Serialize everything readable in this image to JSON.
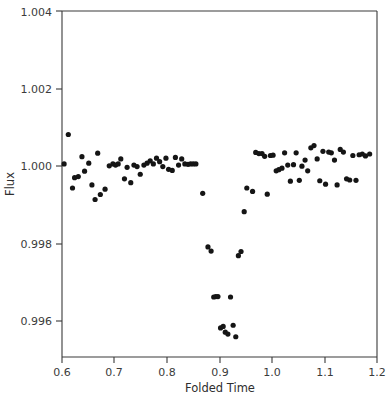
{
  "figure": {
    "background_color": "#ffffff",
    "axis_color": "#3a3a3a",
    "marker_color": "#151515"
  },
  "axes": {
    "xlabel": "Folded Time",
    "ylabel": "Flux",
    "x_ticks": [
      "0.6",
      "0.7",
      "0.8",
      "0.9",
      "1.0",
      "1.1",
      "1.2"
    ],
    "y_ticks": [
      "0.996",
      "0.998",
      "1.000",
      "1.002",
      "1.004"
    ]
  },
  "chart_data": {
    "type": "scatter",
    "title": "",
    "xlabel": "Folded Time",
    "ylabel": "Flux",
    "xlim": [
      0.6,
      1.2
    ],
    "ylim": [
      0.99495,
      1.004
    ],
    "xticks": [
      0.6,
      0.7,
      0.8,
      0.9,
      1.0,
      1.1,
      1.2
    ],
    "yticks": [
      0.996,
      0.998,
      1.0,
      1.002,
      1.004
    ],
    "grid": false,
    "legend": null,
    "marker": "circle",
    "marker_size": 4,
    "marker_color": "#151515",
    "series": [
      {
        "name": "Folded flux",
        "x": [
          0.604,
          0.612,
          0.62,
          0.624,
          0.631,
          0.638,
          0.643,
          0.651,
          0.657,
          0.663,
          0.668,
          0.673,
          0.682,
          0.69,
          0.697,
          0.702,
          0.707,
          0.712,
          0.719,
          0.724,
          0.731,
          0.737,
          0.743,
          0.749,
          0.756,
          0.762,
          0.768,
          0.774,
          0.78,
          0.786,
          0.792,
          0.798,
          0.803,
          0.81,
          0.816,
          0.822,
          0.828,
          0.834,
          0.84,
          0.845,
          0.85,
          0.855,
          0.868,
          0.878,
          0.884,
          0.889,
          0.893,
          0.897,
          0.902,
          0.907,
          0.911,
          0.916,
          0.921,
          0.926,
          0.931,
          0.936,
          0.941,
          0.947,
          0.952,
          0.963,
          0.969,
          0.975,
          0.981,
          0.986,
          0.991,
          0.997,
          1.002,
          1.008,
          1.013,
          1.019,
          1.024,
          1.03,
          1.035,
          1.041,
          1.046,
          1.052,
          1.057,
          1.063,
          1.068,
          1.074,
          1.08,
          1.086,
          1.091,
          1.097,
          1.102,
          1.108,
          1.113,
          1.119,
          1.124,
          1.13,
          1.136,
          1.142,
          1.148,
          1.154,
          1.16,
          1.166,
          1.172,
          1.178,
          1.186
        ],
        "y": [
          1.0,
          1.00077,
          0.99937,
          0.99964,
          0.99967,
          1.00019,
          0.99981,
          1.00002,
          0.99945,
          0.99907,
          1.00028,
          0.9992,
          0.99934,
          0.99995,
          1.0,
          0.99997,
          1.0,
          1.00013,
          0.99961,
          0.99991,
          0.99951,
          0.99997,
          0.99993,
          0.99973,
          0.99997,
          1.00002,
          1.00008,
          1.0,
          1.00015,
          1.00006,
          0.99993,
          1.00015,
          0.99986,
          0.99983,
          1.00017,
          0.99997,
          1.00013,
          1.0,
          0.99999,
          1.0,
          1.0,
          1.0,
          0.99923,
          0.99783,
          0.99772,
          0.99652,
          0.99653,
          0.99653,
          0.99571,
          0.99575,
          0.9956,
          0.99555,
          0.99652,
          0.99578,
          0.99548,
          0.9976,
          0.99771,
          0.99875,
          0.99937,
          0.99928,
          1.0003,
          1.00027,
          1.00027,
          1.0002,
          0.99921,
          1.00022,
          1.00023,
          0.99982,
          0.99985,
          0.99989,
          1.00029,
          0.99997,
          0.99955,
          0.99998,
          1.00029,
          0.99957,
          0.99994,
          1.0001,
          0.99982,
          1.00042,
          1.00048,
          1.00013,
          0.99956,
          1.00033,
          0.99947,
          1.00031,
          1.00029,
          1.0001,
          0.99945,
          1.00038,
          1.00031,
          0.99961,
          0.99958,
          1.00022,
          0.99957,
          1.00024,
          1.00026,
          1.00021,
          1.00026
        ]
      }
    ],
    "annotations": [
      {
        "text": "transit-dip",
        "x_range": [
          0.86,
          0.96
        ],
        "depth": 0.0045
      }
    ]
  }
}
